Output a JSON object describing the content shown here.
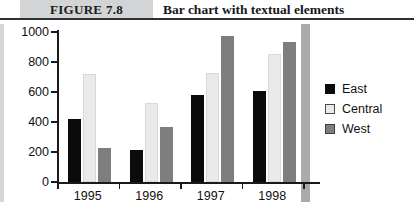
{
  "figure": {
    "number": "FIGURE 7.8",
    "title": "Bar chart with textual elements"
  },
  "chart_data": {
    "type": "bar",
    "title": "Bar chart with textual elements",
    "xlabel": "",
    "ylabel": "",
    "categories": [
      "1995",
      "1996",
      "1997",
      "1998"
    ],
    "series": [
      {
        "name": "East",
        "color": "#0b0b0b",
        "values": [
          420,
          215,
          580,
          605
        ]
      },
      {
        "name": "Central",
        "color": "#eaeaea",
        "values": [
          720,
          530,
          725,
          855
        ]
      },
      {
        "name": "West",
        "color": "#7e7e7e",
        "values": [
          225,
          370,
          975,
          935
        ]
      }
    ],
    "ylim": [
      0,
      1000
    ],
    "yticks": [
      0,
      200,
      400,
      600,
      800,
      1000
    ],
    "ytick_labels": [
      "0",
      "200",
      "400",
      "600",
      "800",
      "1000"
    ],
    "grid": false,
    "legend_position": "right"
  },
  "colors": {
    "east": "#0b0b0b",
    "central": "#eaeaea",
    "west": "#7e7e7e",
    "axis": "#1a1a1a",
    "band": "#d3d4d6"
  }
}
